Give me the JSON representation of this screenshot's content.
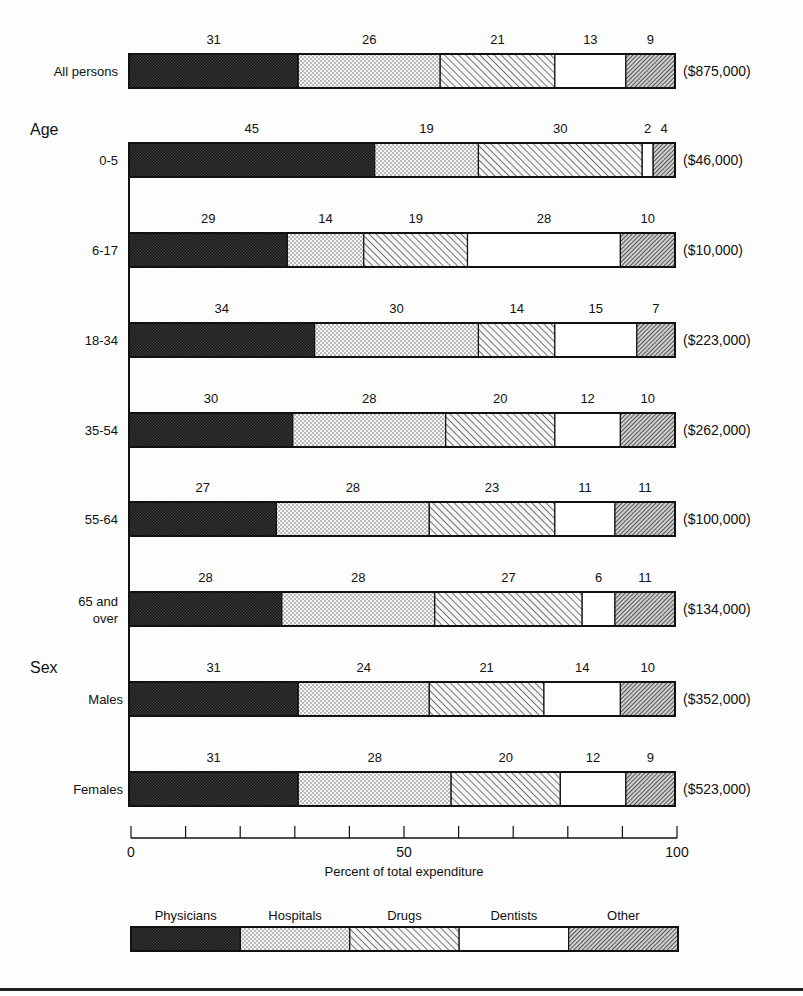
{
  "chart_data": {
    "type": "bar",
    "orientation": "horizontal",
    "stacked": true,
    "title": "",
    "xlabel": "Percent of total expenditure",
    "ylabel": "",
    "xlim": [
      0,
      100
    ],
    "x_ticks": [
      0,
      10,
      20,
      30,
      40,
      50,
      60,
      70,
      80,
      90,
      100
    ],
    "x_tick_labels": [
      {
        "value": 0,
        "label": "0"
      },
      {
        "value": 50,
        "label": "50"
      },
      {
        "value": 100,
        "label": "100"
      }
    ],
    "legend_placement": "bottom",
    "series_names": [
      "Physicians",
      "Hospitals",
      "Drugs",
      "Dentists",
      "Other"
    ],
    "groups": [
      {
        "label": "",
        "rows": [
          0
        ]
      },
      {
        "label": "Age",
        "rows": [
          1,
          2,
          3,
          4,
          5,
          6
        ]
      },
      {
        "label": "Sex",
        "rows": [
          7,
          8
        ]
      }
    ],
    "rows": [
      {
        "label": "All persons",
        "label_lines": [
          "All persons"
        ],
        "total": "($875,000)",
        "values": [
          31,
          26,
          21,
          13,
          9
        ]
      },
      {
        "label": "0-5",
        "label_lines": [
          "0-5"
        ],
        "total": "($46,000)",
        "values": [
          45,
          19,
          30,
          2,
          4
        ]
      },
      {
        "label": "6-17",
        "label_lines": [
          "6-17"
        ],
        "total": "($10,000)",
        "values": [
          29,
          14,
          19,
          28,
          10
        ]
      },
      {
        "label": "18-34",
        "label_lines": [
          "18-34"
        ],
        "total": "($223,000)",
        "values": [
          34,
          30,
          14,
          15,
          7
        ]
      },
      {
        "label": "35-54",
        "label_lines": [
          "35-54"
        ],
        "total": "($262,000)",
        "values": [
          30,
          28,
          20,
          12,
          10
        ]
      },
      {
        "label": "55-64",
        "label_lines": [
          "55-64"
        ],
        "total": "($100,000)",
        "values": [
          27,
          28,
          23,
          11,
          11
        ]
      },
      {
        "label": "65 and over",
        "label_lines": [
          "65 and",
          "over"
        ],
        "total": "($134,000)",
        "values": [
          28,
          28,
          27,
          6,
          11
        ]
      },
      {
        "label": "Males",
        "label_lines": [
          "Males"
        ],
        "total": "($352,000)",
        "values": [
          31,
          24,
          21,
          14,
          10
        ]
      },
      {
        "label": "Females",
        "label_lines": [
          "Females"
        ],
        "total": "($523,000)",
        "values": [
          31,
          28,
          20,
          12,
          9
        ]
      }
    ]
  },
  "colors": {
    "ink": "#111111",
    "physicians": "#2a2a2a",
    "hospitals_dot": "#555555",
    "drugs_hatch": "#333333",
    "dentists": "#ffffff",
    "other_hatch": "#222222",
    "background": "#fdfdfd"
  }
}
